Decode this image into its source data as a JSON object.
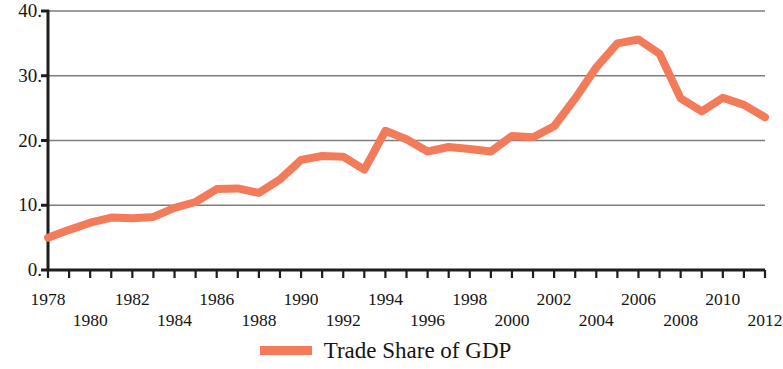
{
  "chart_data": {
    "type": "line",
    "title": "",
    "xlabel": "",
    "ylabel": "",
    "xlim": [
      1978,
      2012
    ],
    "ylim": [
      0,
      40
    ],
    "grid": true,
    "gridlines_y": [
      0,
      10,
      20,
      30,
      40
    ],
    "legend_position": "bottom-center",
    "y_ticks": [
      "0.",
      "10.",
      "20.",
      "30.",
      "40."
    ],
    "x_ticks_top_row": [
      "1978",
      "1982",
      "1986",
      "1990",
      "1994",
      "1998",
      "2002",
      "2006",
      "2010"
    ],
    "x_ticks_bottom_row": [
      "1980",
      "1984",
      "1988",
      "1992",
      "1996",
      "2000",
      "2004",
      "2008",
      "2012"
    ],
    "series": [
      {
        "name": "Trade Share of GDP",
        "color": "#F47B5A",
        "x": [
          1978,
          1979,
          1980,
          1981,
          1982,
          1983,
          1984,
          1985,
          1986,
          1987,
          1988,
          1989,
          1990,
          1991,
          1992,
          1993,
          1994,
          1995,
          1996,
          1997,
          1998,
          1999,
          2000,
          2001,
          2002,
          2003,
          2004,
          2005,
          2006,
          2007,
          2008,
          2009,
          2010,
          2011,
          2012
        ],
        "values": [
          5.0,
          6.2,
          7.3,
          8.1,
          8.0,
          8.2,
          9.6,
          10.5,
          12.5,
          12.6,
          11.9,
          14.0,
          17.0,
          17.6,
          17.5,
          15.5,
          21.5,
          20.2,
          18.3,
          19.0,
          18.7,
          18.3,
          20.7,
          20.5,
          22.2,
          26.5,
          31.3,
          35.0,
          35.6,
          33.4,
          26.5,
          24.5,
          26.6,
          25.5,
          23.6
        ]
      }
    ]
  },
  "legend": {
    "label": "Trade Share of GDP",
    "swatch_color": "#F47B5A"
  },
  "axes": {
    "y_labels": [
      {
        "text": "40.",
        "value": 40
      },
      {
        "text": "30.",
        "value": 30
      },
      {
        "text": "20.",
        "value": 20
      },
      {
        "text": "10.",
        "value": 10
      },
      {
        "text": "0.",
        "value": 0
      }
    ],
    "x_labels_top": [
      {
        "text": "1978",
        "value": 1978
      },
      {
        "text": "1982",
        "value": 1982
      },
      {
        "text": "1986",
        "value": 1986
      },
      {
        "text": "1990",
        "value": 1990
      },
      {
        "text": "1994",
        "value": 1994
      },
      {
        "text": "1998",
        "value": 1998
      },
      {
        "text": "2002",
        "value": 2002
      },
      {
        "text": "2006",
        "value": 2006
      },
      {
        "text": "2010",
        "value": 2010
      }
    ],
    "x_labels_bottom": [
      {
        "text": "1980",
        "value": 1980
      },
      {
        "text": "1984",
        "value": 1984
      },
      {
        "text": "1988",
        "value": 1988
      },
      {
        "text": "1992",
        "value": 1992
      },
      {
        "text": "1996",
        "value": 1996
      },
      {
        "text": "2000",
        "value": 2000
      },
      {
        "text": "2004",
        "value": 2004
      },
      {
        "text": "2008",
        "value": 2008
      },
      {
        "text": "2012",
        "value": 2012
      }
    ]
  },
  "style": {
    "axis_color": "#1d1d1d",
    "grid_color": "#7d7d7d",
    "plot_left": 48,
    "plot_right": 765,
    "plot_top": 11,
    "plot_bottom": 270
  }
}
